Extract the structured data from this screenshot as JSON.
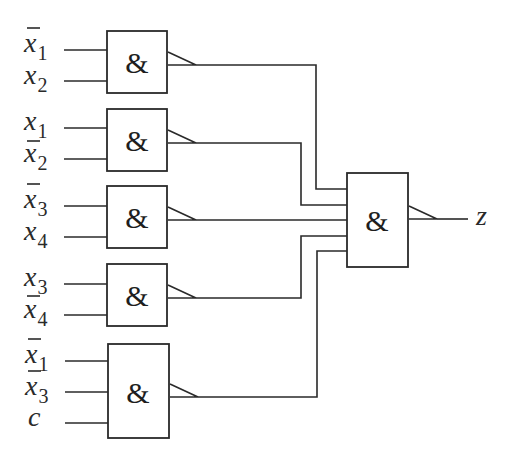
{
  "diagram": {
    "type": "logic-circuit",
    "gate_symbol": "&",
    "output_label": "z",
    "gates": [
      {
        "id": "and1",
        "inputs": [
          {
            "var": "x",
            "sub": "1",
            "negated": true
          },
          {
            "var": "x",
            "sub": "2",
            "negated": false
          }
        ]
      },
      {
        "id": "and2",
        "inputs": [
          {
            "var": "x",
            "sub": "1",
            "negated": false
          },
          {
            "var": "x",
            "sub": "2",
            "negated": true
          }
        ]
      },
      {
        "id": "and3",
        "inputs": [
          {
            "var": "x",
            "sub": "3",
            "negated": true
          },
          {
            "var": "x",
            "sub": "4",
            "negated": false
          }
        ]
      },
      {
        "id": "and4",
        "inputs": [
          {
            "var": "x",
            "sub": "3",
            "negated": false
          },
          {
            "var": "x",
            "sub": "4",
            "negated": true
          }
        ]
      },
      {
        "id": "and5",
        "inputs": [
          {
            "var": "x",
            "sub": "1",
            "negated": true
          },
          {
            "var": "x",
            "sub": "3",
            "negated": true
          },
          {
            "var": "c",
            "sub": "",
            "negated": false
          }
        ]
      }
    ],
    "final_gate": {
      "id": "and-final",
      "inputs_from": [
        "and1",
        "and2",
        "and3",
        "and4",
        "and5"
      ],
      "output": "z"
    },
    "labels": {
      "g1_in1_var": "x",
      "g1_in1_sub": "1",
      "g1_in2_var": "x",
      "g1_in2_sub": "2",
      "g2_in1_var": "x",
      "g2_in1_sub": "1",
      "g2_in2_var": "x",
      "g2_in2_sub": "2",
      "g3_in1_var": "x",
      "g3_in1_sub": "3",
      "g3_in2_var": "x",
      "g3_in2_sub": "4",
      "g4_in1_var": "x",
      "g4_in1_sub": "3",
      "g4_in2_var": "x",
      "g4_in2_sub": "4",
      "g5_in1_var": "x",
      "g5_in1_sub": "1",
      "g5_in2_var": "x",
      "g5_in2_sub": "3",
      "g5_in3_var": "c",
      "amp": "&",
      "z": "z"
    }
  }
}
